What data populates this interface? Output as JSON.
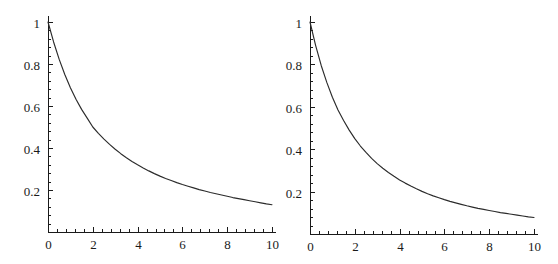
{
  "figure": {
    "background_color": "#ffffff",
    "panel_count": 2
  },
  "chart_data": [
    {
      "type": "line",
      "title": "",
      "subtitle": "",
      "xlabel": "",
      "ylabel": "",
      "xlim": [
        0,
        10
      ],
      "ylim": [
        0,
        1
      ],
      "grid": false,
      "legend": "none",
      "axis_color": "#1a1a1a",
      "line_color": "#2b2b2b",
      "xticks": [
        0,
        2,
        4,
        6,
        8,
        10
      ],
      "xtick_labels": [
        "0",
        "2",
        "4",
        "6",
        "8",
        "10"
      ],
      "xminor_step": 0.4,
      "yticks": [
        0.2,
        0.4,
        0.6,
        0.8,
        1
      ],
      "ytick_labels": [
        "0.2",
        "0.4",
        "0.6",
        "0.8",
        "1"
      ],
      "yminor_step": 0.04,
      "x": [
        0,
        0.25,
        0.5,
        0.75,
        1,
        1.25,
        1.5,
        1.75,
        2,
        2.25,
        2.5,
        2.75,
        3,
        3.25,
        3.5,
        3.75,
        4,
        4.25,
        4.5,
        4.75,
        5,
        5.25,
        5.5,
        5.75,
        6,
        6.25,
        6.5,
        6.75,
        7,
        7.25,
        7.5,
        7.75,
        8,
        8.25,
        8.5,
        8.75,
        9,
        9.25,
        9.5,
        9.75,
        10
      ],
      "values": [
        1.0,
        0.905,
        0.822,
        0.75,
        0.687,
        0.632,
        0.584,
        0.542,
        0.5,
        0.47,
        0.442,
        0.417,
        0.394,
        0.373,
        0.354,
        0.336,
        0.32,
        0.305,
        0.291,
        0.278,
        0.266,
        0.255,
        0.245,
        0.235,
        0.226,
        0.218,
        0.21,
        0.202,
        0.195,
        0.188,
        0.182,
        0.176,
        0.17,
        0.164,
        0.159,
        0.154,
        0.149,
        0.144,
        0.139,
        0.134,
        0.13
      ]
    },
    {
      "type": "line",
      "title": "",
      "subtitle": "",
      "xlabel": "",
      "ylabel": "",
      "xlim": [
        0,
        10
      ],
      "ylim": [
        0,
        1
      ],
      "grid": false,
      "legend": "none",
      "axis_color": "#1a1a1a",
      "line_color": "#2b2b2b",
      "xticks": [
        0,
        2,
        4,
        6,
        8,
        10
      ],
      "xtick_labels": [
        "0",
        "2",
        "4",
        "6",
        "8",
        "10"
      ],
      "xminor_step": 0.4,
      "yticks": [
        0.2,
        0.4,
        0.6,
        0.8,
        1
      ],
      "ytick_labels": [
        "0.2",
        "0.4",
        "0.6",
        "0.8",
        "1"
      ],
      "yminor_step": 0.04,
      "x": [
        0,
        0.25,
        0.5,
        0.75,
        1,
        1.25,
        1.5,
        1.75,
        2,
        2.25,
        2.5,
        2.75,
        3,
        3.25,
        3.5,
        3.75,
        4,
        4.25,
        4.5,
        4.75,
        5,
        5.25,
        5.5,
        5.75,
        6,
        6.25,
        6.5,
        6.75,
        7,
        7.25,
        7.5,
        7.75,
        8,
        8.25,
        8.5,
        8.75,
        9,
        9.25,
        9.5,
        9.75,
        10
      ],
      "values": [
        1.0,
        0.89,
        0.795,
        0.715,
        0.645,
        0.585,
        0.535,
        0.49,
        0.45,
        0.415,
        0.385,
        0.357,
        0.332,
        0.31,
        0.29,
        0.272,
        0.255,
        0.24,
        0.226,
        0.213,
        0.201,
        0.19,
        0.18,
        0.171,
        0.162,
        0.154,
        0.147,
        0.14,
        0.133,
        0.127,
        0.121,
        0.116,
        0.111,
        0.106,
        0.101,
        0.097,
        0.093,
        0.089,
        0.085,
        0.081,
        0.078
      ]
    }
  ]
}
